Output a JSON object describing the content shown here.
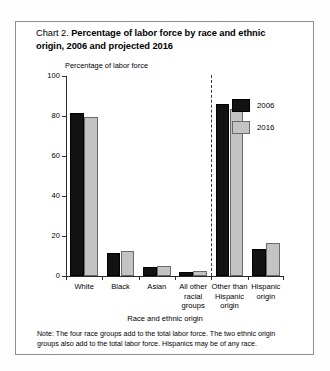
{
  "figure": {
    "label_prefix": "Chart 2.",
    "title_part1": "Percentage of labor force by race and ethnic",
    "title_part2": "origin, 2006 and projected 2016",
    "note": "Note:  The four race groups add to the total labor force. The two ethnic origin groups also add to the total labor force. Hispanics may be of any race."
  },
  "chart_data": {
    "type": "bar",
    "title": "Chart 2. Percentage of labor force by race and ethnic origin, 2006 and projected 2016",
    "xlabel": "Race and ethnic origin",
    "ylabel": "Percentage of labor force",
    "ylim": [
      0,
      100
    ],
    "yticks": [
      0,
      20,
      40,
      60,
      80,
      100
    ],
    "grid": false,
    "legend_position": "upper-right-inside",
    "categories": [
      "White",
      "Black",
      "Asian",
      "All other\nracial\ngroups",
      "Other than\nHispanic\norigin",
      "Hispanic\norigin"
    ],
    "series": [
      {
        "name": "2006",
        "color": "#121212",
        "values": [
          81.5,
          11.4,
          4.4,
          1.8,
          86.0,
          13.7
        ]
      },
      {
        "name": "2016",
        "color": "#c3c3c3",
        "values": [
          79.6,
          12.3,
          5.1,
          2.7,
          83.4,
          16.4
        ]
      }
    ],
    "annotations": [
      {
        "type": "vertical-dashed-divider",
        "after_category_index": 3
      }
    ]
  }
}
